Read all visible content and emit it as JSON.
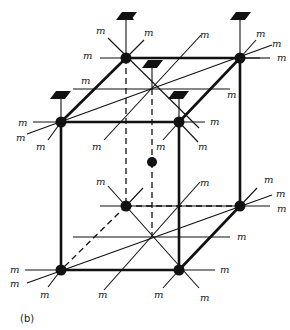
{
  "figure": {
    "caption": "(b)",
    "mirror_label": "m"
  },
  "nodes": {
    "top_back_left": {
      "x": 126,
      "y": 58
    },
    "top_back_right": {
      "x": 240,
      "y": 58
    },
    "top_front_left": {
      "x": 61,
      "y": 122
    },
    "top_front_right": {
      "x": 179,
      "y": 122
    },
    "body_center": {
      "x": 152,
      "y": 162
    },
    "bottom_back_left": {
      "x": 126,
      "y": 206
    },
    "bottom_back_right": {
      "x": 240,
      "y": 206
    },
    "bottom_front_left": {
      "x": 61,
      "y": 270
    },
    "bottom_front_right": {
      "x": 179,
      "y": 270
    }
  },
  "labels": [
    {
      "text": "m",
      "x": 96,
      "y": 34
    },
    {
      "text": "m",
      "x": 144,
      "y": 36
    },
    {
      "text": "m",
      "x": 83,
      "y": 59
    },
    {
      "text": "m",
      "x": 200,
      "y": 38
    },
    {
      "text": "m",
      "x": 256,
      "y": 37
    },
    {
      "text": "m",
      "x": 272,
      "y": 47
    },
    {
      "text": "m",
      "x": 277,
      "y": 61
    },
    {
      "text": "m",
      "x": 81,
      "y": 84
    },
    {
      "text": "m",
      "x": 227,
      "y": 98
    },
    {
      "text": "m",
      "x": 18,
      "y": 126
    },
    {
      "text": "m",
      "x": 16,
      "y": 141
    },
    {
      "text": "m",
      "x": 36,
      "y": 150
    },
    {
      "text": "m",
      "x": 92,
      "y": 150
    },
    {
      "text": "m",
      "x": 156,
      "y": 150
    },
    {
      "text": "m",
      "x": 198,
      "y": 150
    },
    {
      "text": "m",
      "x": 210,
      "y": 125
    },
    {
      "text": "m",
      "x": 96,
      "y": 185
    },
    {
      "text": "m",
      "x": 200,
      "y": 186
    },
    {
      "text": "m",
      "x": 264,
      "y": 183
    },
    {
      "text": "m",
      "x": 276,
      "y": 197
    },
    {
      "text": "m",
      "x": 277,
      "y": 212
    },
    {
      "text": "m",
      "x": 237,
      "y": 240
    },
    {
      "text": "m",
      "x": 10,
      "y": 273
    },
    {
      "text": "m",
      "x": 10,
      "y": 287
    },
    {
      "text": "m",
      "x": 40,
      "y": 298
    },
    {
      "text": "m",
      "x": 98,
      "y": 298
    },
    {
      "text": "m",
      "x": 154,
      "y": 298
    },
    {
      "text": "m",
      "x": 200,
      "y": 301
    },
    {
      "text": "m",
      "x": 220,
      "y": 273
    }
  ]
}
